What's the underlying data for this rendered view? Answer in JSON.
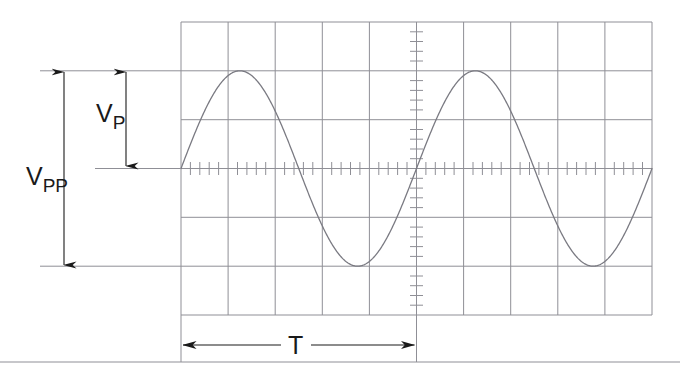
{
  "figure": {
    "background_color": "#ffffff",
    "grid_color": "#8f8f96",
    "trace_color": "#7a7a82",
    "annotation_color": "#1a1a1a"
  },
  "labels": {
    "vpp": {
      "base": "V",
      "sub": "PP"
    },
    "vp": {
      "base": "V",
      "sub": "P"
    },
    "period": {
      "base": "T",
      "sub": ""
    }
  },
  "graticule": {
    "left": 181,
    "top": 22,
    "right": 652,
    "bottom": 315,
    "columns": 10,
    "rows": 6,
    "column_width": 47.1,
    "row_height": 48.83,
    "minor_ticks_per_division": 5,
    "center_x": 416.5,
    "center_y": 168.5
  },
  "chart_data": {
    "type": "line",
    "title": "",
    "xlabel": "",
    "ylabel": "",
    "grid": true,
    "legend": false,
    "x_divisions": 10,
    "y_divisions": 6,
    "amplitude_divisions": 2,
    "period_divisions": 5,
    "phase_start": "zero-crossing-rising",
    "cycles_shown": 2,
    "series": [
      {
        "name": "sine-wave",
        "waveform": "sine",
        "amplitude_px": 97.7,
        "period_px": 235.5,
        "x_start_px": 181,
        "x_end_px": 652,
        "baseline_y_px": 168.5,
        "peak_y_px": 70.8,
        "trough_y_px": 266.2,
        "peak_x_px": [
          239.9,
          475.4
        ],
        "trough_x_px": [
          357.6,
          593.1
        ]
      }
    ]
  },
  "annotations": {
    "vpp_dimension": {
      "label_key": "vpp",
      "orientation": "vertical",
      "x_px": 64,
      "y_top_px": 71,
      "y_bottom_px": 267,
      "span_px": 196,
      "meaning": "peak-to-peak voltage",
      "label_x_px": 42,
      "label_y_px": 176
    },
    "vp_dimension": {
      "label_key": "vp",
      "orientation": "vertical",
      "x_px": 126,
      "y_top_px": 71,
      "y_bottom_px": 168,
      "span_px": 97,
      "meaning": "peak voltage",
      "label_x_px": 106,
      "label_y_px": 113
    },
    "period_dimension": {
      "label_key": "period",
      "orientation": "horizontal",
      "y_px": 345,
      "x_left_px": 181,
      "x_right_px": 416,
      "span_px": 235,
      "meaning": "period of one cycle",
      "label_x_px": 292,
      "label_y_px": 353
    },
    "reference_lines": [
      {
        "name": "positive-peak-reference",
        "y_px": 71,
        "x_start_px": 40,
        "x_end_px": 181
      },
      {
        "name": "zero-reference",
        "y_px": 168,
        "x_start_px": 95,
        "x_end_px": 181
      },
      {
        "name": "negative-peak-reference",
        "y_px": 267,
        "x_start_px": 40,
        "x_end_px": 181
      },
      {
        "name": "page-rule",
        "y_px": 362,
        "x_start_px": 0,
        "x_end_px": 680
      }
    ],
    "extension_lines": [
      {
        "name": "period-left-extension",
        "x_px": 181,
        "y_start_px": 315,
        "y_end_px": 362
      },
      {
        "name": "period-right-extension",
        "x_px": 416,
        "y_start_px": 315,
        "y_end_px": 362
      }
    ]
  }
}
